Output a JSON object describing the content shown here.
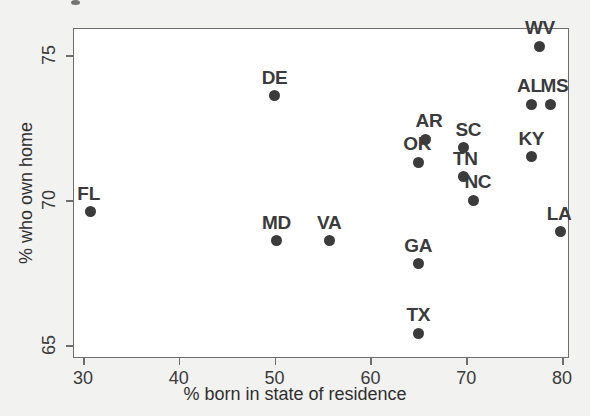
{
  "chart_data": {
    "type": "scatter",
    "title": "",
    "xlabel": "% born in state of residence",
    "ylabel": "% who own home",
    "xlim": [
      28.5,
      80.5
    ],
    "ylim": [
      64.3,
      76.2
    ],
    "xticks": [
      30,
      40,
      50,
      60,
      70,
      80
    ],
    "yticks": [
      65,
      70,
      75
    ],
    "grid": false,
    "legend": null,
    "marker": {
      "shape": "circle",
      "color": "#3b3b3b",
      "size_px": 11
    },
    "point_label_color": "#3b3b3b",
    "frame_color": "#6e6e6e",
    "plot_background": "#ffffff",
    "figure_background": "#f2f2f0",
    "points": [
      {
        "label": "FL",
        "x": 30.8,
        "y": 69.6,
        "label_dx": -2,
        "label_dy": -9
      },
      {
        "label": "DE",
        "x": 50.0,
        "y": 73.6,
        "label_dx": 0,
        "label_dy": -9
      },
      {
        "label": "MD",
        "x": 50.2,
        "y": 68.6,
        "label_dx": 0,
        "label_dy": -9
      },
      {
        "label": "VA",
        "x": 55.7,
        "y": 68.6,
        "label_dx": 0,
        "label_dy": -9
      },
      {
        "label": "GA",
        "x": 65.0,
        "y": 67.8,
        "label_dx": 0,
        "label_dy": -9
      },
      {
        "label": "TX",
        "x": 65.0,
        "y": 65.4,
        "label_dx": 0,
        "label_dy": -9
      },
      {
        "label": "OK",
        "x": 65.0,
        "y": 71.3,
        "label_dx": -1,
        "label_dy": -9
      },
      {
        "label": "AR",
        "x": 65.8,
        "y": 72.1,
        "label_dx": 3,
        "label_dy": -9
      },
      {
        "label": "SC",
        "x": 69.7,
        "y": 71.8,
        "label_dx": 5,
        "label_dy": -9
      },
      {
        "label": "TN",
        "x": 69.7,
        "y": 70.8,
        "label_dx": 2,
        "label_dy": -9
      },
      {
        "label": "NC",
        "x": 70.8,
        "y": 70.0,
        "label_dx": 4,
        "label_dy": -9
      },
      {
        "label": "KY",
        "x": 76.8,
        "y": 71.5,
        "label_dx": 0,
        "label_dy": -9
      },
      {
        "label": "AL",
        "x": 76.8,
        "y": 73.3,
        "label_dx": -2,
        "label_dy": -9
      },
      {
        "label": "MS",
        "x": 78.8,
        "y": 73.3,
        "label_dx": 4,
        "label_dy": -9
      },
      {
        "label": "WV",
        "x": 77.7,
        "y": 75.3,
        "label_dx": 0,
        "label_dy": -9
      },
      {
        "label": "LA",
        "x": 79.8,
        "y": 68.9,
        "label_dx": -1,
        "label_dy": -9
      }
    ]
  }
}
